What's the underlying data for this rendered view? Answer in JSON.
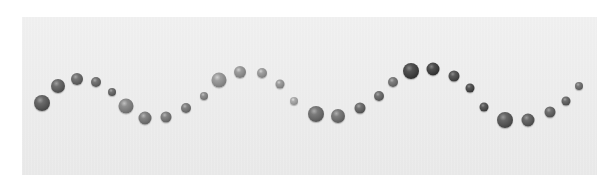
{
  "scene": {
    "description": "Row of glossy grayscale spheres arranged along a sine wave on a light gray backdrop",
    "background_color": "#ffffff",
    "panel_color": "#ececec",
    "panel": {
      "left": 22,
      "top": 17,
      "width": 575,
      "height": 158
    }
  },
  "beads": [
    {
      "x": 42,
      "y": 103,
      "d": 16,
      "color": "#555555"
    },
    {
      "x": 58,
      "y": 86,
      "d": 14,
      "color": "#5a5a5a"
    },
    {
      "x": 77,
      "y": 79,
      "d": 12,
      "color": "#606060"
    },
    {
      "x": 96,
      "y": 82,
      "d": 10,
      "color": "#626262"
    },
    {
      "x": 112,
      "y": 92,
      "d": 8,
      "color": "#5e5e5e"
    },
    {
      "x": 126,
      "y": 106,
      "d": 15,
      "color": "#7a7a7a"
    },
    {
      "x": 145,
      "y": 118,
      "d": 13,
      "color": "#707070"
    },
    {
      "x": 166,
      "y": 117,
      "d": 11,
      "color": "#707070"
    },
    {
      "x": 186,
      "y": 108,
      "d": 10,
      "color": "#6e6e6e"
    },
    {
      "x": 204,
      "y": 96,
      "d": 8,
      "color": "#7c7c7c"
    },
    {
      "x": 219,
      "y": 80,
      "d": 15,
      "color": "#8a8a8a"
    },
    {
      "x": 240,
      "y": 72,
      "d": 12,
      "color": "#888888"
    },
    {
      "x": 262,
      "y": 73,
      "d": 10,
      "color": "#8c8c8c"
    },
    {
      "x": 280,
      "y": 84,
      "d": 9,
      "color": "#8a8a8a"
    },
    {
      "x": 294,
      "y": 101,
      "d": 8,
      "color": "#999999"
    },
    {
      "x": 316,
      "y": 114,
      "d": 16,
      "color": "#666666"
    },
    {
      "x": 338,
      "y": 116,
      "d": 14,
      "color": "#6a6a6a"
    },
    {
      "x": 360,
      "y": 108,
      "d": 11,
      "color": "#5e5e5e"
    },
    {
      "x": 379,
      "y": 96,
      "d": 10,
      "color": "#606060"
    },
    {
      "x": 393,
      "y": 82,
      "d": 10,
      "color": "#6a6a6a"
    },
    {
      "x": 411,
      "y": 71,
      "d": 16,
      "color": "#3e3e3e"
    },
    {
      "x": 433,
      "y": 69,
      "d": 13,
      "color": "#3c3c3c"
    },
    {
      "x": 454,
      "y": 76,
      "d": 11,
      "color": "#474747"
    },
    {
      "x": 470,
      "y": 88,
      "d": 9,
      "color": "#444444"
    },
    {
      "x": 484,
      "y": 107,
      "d": 9,
      "color": "#484848"
    },
    {
      "x": 505,
      "y": 120,
      "d": 16,
      "color": "#525252"
    },
    {
      "x": 528,
      "y": 120,
      "d": 13,
      "color": "#565656"
    },
    {
      "x": 550,
      "y": 112,
      "d": 11,
      "color": "#5c5c5c"
    },
    {
      "x": 566,
      "y": 101,
      "d": 9,
      "color": "#5a5a5a"
    },
    {
      "x": 579,
      "y": 86,
      "d": 8,
      "color": "#666666"
    }
  ]
}
